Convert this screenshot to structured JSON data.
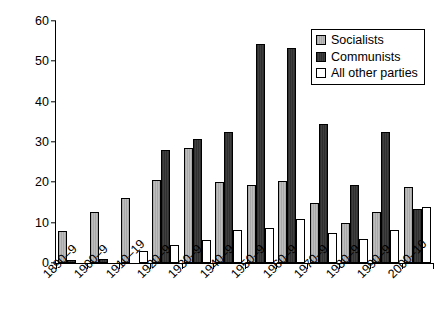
{
  "chart_data": {
    "type": "bar",
    "title": "",
    "subtitle": "",
    "xlabel": "",
    "ylabel": "",
    "ylim": [
      0,
      60
    ],
    "yticks": [
      0,
      10,
      20,
      30,
      40,
      50,
      60
    ],
    "grid": false,
    "legend_position": "top-right",
    "categories": [
      "1890–9",
      "1900–9",
      "1910–19",
      "1920–9",
      "1930–9",
      "1940–9",
      "1950–9",
      "1960–9",
      "1970–9",
      "1980–9",
      "1990–9",
      "2000–10"
    ],
    "series": [
      {
        "name": "Socialists",
        "color": "#b4b4b4",
        "values": [
          8.0,
          12.6,
          16.0,
          20.5,
          28.5,
          20.0,
          19.3,
          20.3,
          15.0,
          10.0,
          12.7,
          18.8
        ]
      },
      {
        "name": "Communists",
        "color": "#363636",
        "values": [
          0.7,
          0.9,
          0.0,
          28.0,
          30.7,
          32.4,
          54.4,
          53.3,
          34.5,
          19.3,
          32.5,
          13.3
        ]
      },
      {
        "name": "All other parties",
        "color": "#ffffff",
        "values": [
          0.0,
          0.0,
          3.1,
          4.5,
          5.8,
          8.1,
          8.7,
          11.0,
          7.5,
          6.0,
          8.1,
          14.0
        ]
      }
    ]
  },
  "legend": {
    "items": [
      {
        "label": "Socialists"
      },
      {
        "label": "Communists"
      },
      {
        "label": "All other parties"
      }
    ]
  }
}
